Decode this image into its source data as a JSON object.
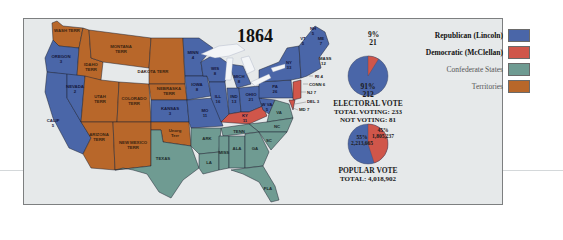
{
  "map": {
    "title": "1864",
    "colors": {
      "republican": "#4a66a8",
      "democratic": "#d0564a",
      "confederate": "#6f9b92",
      "territories": "#b8672a",
      "water": "#f3f5f7",
      "background": "#e6e9ea",
      "border": "#1e2230"
    },
    "states": {
      "wash": "WASH TERR",
      "oregon": "OREGON",
      "oregon_ev": "3",
      "calif": "CALIF",
      "calif_ev": "5",
      "nevada": "NEVADA",
      "nevada_ev": "2",
      "idaho": "IDAHO TERR",
      "montana": "MONTANA TERR",
      "dakota": "DAKOTA TERR",
      "utah": "UTAH TERR",
      "colorado": "COLORADO TERR",
      "nebraska": "NEBRASKA TERR",
      "arizona": "ARIZONA TERR",
      "newmexico": "NEW MEXICO TERR",
      "kansas": "KANSAS",
      "kansas_ev": "3",
      "unorg": "Unorg Terr",
      "texas": "TEXAS",
      "minn": "MINN",
      "minn_ev": "4",
      "iowa": "IOWA",
      "iowa_ev": "8",
      "mo": "MO",
      "mo_ev": "11",
      "wis": "WIS",
      "wis_ev": "8",
      "mich": "MICH",
      "mich_ev": "8",
      "ill": "ILL",
      "ill_ev": "16",
      "ind": "IND",
      "ind_ev": "13",
      "ohio": "OHIO",
      "ohio_ev": "21",
      "ky": "KY",
      "ky_ev": "11",
      "pa": "PA",
      "pa_ev": "26",
      "ny": "NY",
      "ny_ev": "33",
      "wva": "W VA",
      "wva_ev": "5",
      "va": "VA",
      "nc": "NC",
      "sc": "SC",
      "ga": "GA",
      "ala": "ALA",
      "miss": "MISS",
      "la": "LA",
      "ark": "ARK",
      "tenn": "TENN",
      "fla": "FLA",
      "vt": "VT",
      "vt_ev": "5",
      "nh": "NH",
      "nh_ev": "5",
      "me": "ME",
      "me_ev": "7",
      "mass": "MASS",
      "mass_ev": "12",
      "ri": "RI 4",
      "conn": "CONN 6",
      "nj": "NJ 7",
      "del": "DEL 3",
      "md": "MD 7"
    }
  },
  "electoral_vote": {
    "title": "ELECTORAL VOTE",
    "total_voting": "TOTAL VOTING:  233",
    "not_voting": "NOT VOTING:  81",
    "republican_pct": "91%",
    "republican_votes": "212",
    "democratic_pct": "9%",
    "democratic_votes": "21"
  },
  "popular_vote": {
    "title": "POPULAR VOTE",
    "total": "TOTAL:  4,018,902",
    "republican_pct": "55%",
    "republican_votes": "2,213,665",
    "democratic_pct": "45%",
    "democratic_votes": "1,805,237"
  },
  "legend": {
    "items": [
      {
        "label": "Republican (Lincoln)",
        "color": "#4a66a8"
      },
      {
        "label": "Democratic (McClellan)",
        "color": "#d0564a"
      },
      {
        "label": "Confederate States",
        "color": "#6f9b92"
      },
      {
        "label": "Territories",
        "color": "#b8672a"
      }
    ]
  }
}
